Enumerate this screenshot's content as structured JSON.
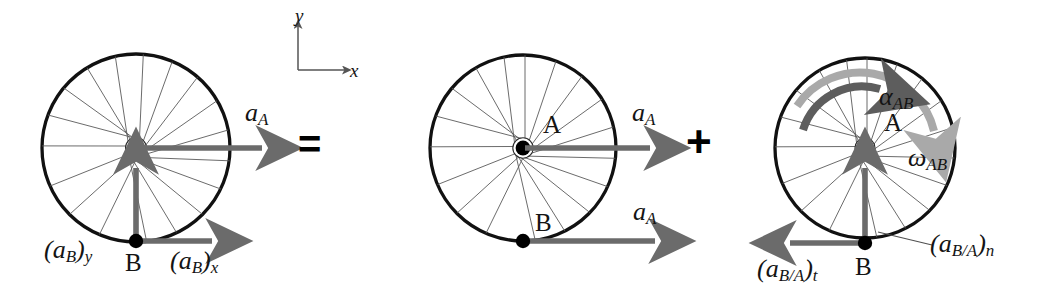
{
  "figure": {
    "equation_symbols": {
      "equals": "=",
      "plus": "+"
    },
    "colors": {
      "rim": "#111111",
      "spoke": "#4a4a4a",
      "vector_arrow": "#6b6b6b",
      "alpha_arrow": "#5d5d5d",
      "omega_arrow": "#a9a9a9",
      "hub": "#000000",
      "axis": "#555555",
      "background": "#ffffff"
    }
  },
  "axes": {
    "name": "coordinate-axes",
    "x_label": "x",
    "y_label": "y"
  },
  "panels": [
    {
      "id": "panel-left",
      "name": "absolute-acceleration-wheel",
      "center_label": "",
      "contact_label": "B",
      "vectors": [
        {
          "name": "a-A-center",
          "label": "a",
          "sub": "A",
          "direction": "right",
          "origin": "A"
        },
        {
          "name": "aB-y",
          "label": "(a",
          "sub": "B",
          "label2": ")",
          "sub2": "y",
          "full": "(aB)y",
          "direction": "up",
          "origin": "B"
        },
        {
          "name": "aB-x",
          "label": "(a",
          "sub": "B",
          "label2": ")",
          "sub2": "x",
          "full": "(aB)x",
          "direction": "right",
          "origin": "B"
        }
      ]
    },
    {
      "id": "panel-middle",
      "name": "translation-wheel",
      "center_label": "A",
      "contact_label": "B",
      "vectors": [
        {
          "name": "a-A-center",
          "label": "a",
          "sub": "A",
          "direction": "right",
          "origin": "A"
        },
        {
          "name": "a-A-at-B",
          "label": "a",
          "sub": "A",
          "direction": "right",
          "origin": "B"
        }
      ]
    },
    {
      "id": "panel-right",
      "name": "rotation-wheel",
      "center_label": "A",
      "contact_label": "B",
      "vectors": [
        {
          "name": "aBA-t",
          "full": "(aB/A)t",
          "direction": "left",
          "origin": "B"
        },
        {
          "name": "aBA-n",
          "full": "(aB/A)n",
          "direction": "up",
          "origin": "B"
        }
      ],
      "rotations": [
        {
          "name": "alpha-AB",
          "label": "α",
          "sub": "AB",
          "style": "dark"
        },
        {
          "name": "omega-AB",
          "label": "ω",
          "sub": "AB",
          "style": "light"
        }
      ]
    }
  ],
  "labels": {
    "a_main": "a",
    "a_sub_A": "A",
    "aB_open": "(a",
    "aB_sub_B": "B",
    "aB_close": ")",
    "aB_sub_y": "y",
    "aB_sub_x": "x",
    "point_A": "A",
    "point_B": "B",
    "aBA_open": "(a",
    "aBA_sub_BA": "B/A",
    "aBA_close": ")",
    "aBA_sub_t": "t",
    "aBA_sub_n": "n",
    "alpha": "α",
    "omega": "ω",
    "sub_AB": "AB",
    "axis_x": "x",
    "axis_y": "y",
    "equals": "=",
    "plus": "+"
  }
}
